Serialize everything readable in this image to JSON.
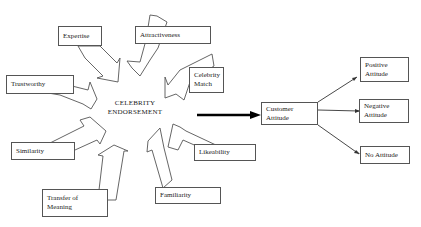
{
  "diagram": {
    "center": {
      "line1": "CELEBRITY",
      "line2": "ENDORSEMENT"
    },
    "factors": {
      "expertise": "Expertise",
      "attractiveness": "Attractiveness",
      "celebrity_match_1": "Celebrity",
      "celebrity_match_2": "Match",
      "trustworthy": "Trustworthy",
      "similarity": "Similarity",
      "transfer_1": "Transfer of",
      "transfer_2": "Meaning",
      "familiarity": "Familiarity",
      "likeability": "Likeability"
    },
    "customer_attitude": {
      "line1": "Customer",
      "line2": "Attitude"
    },
    "outcomes": {
      "positive_1": "Positive",
      "positive_2": "Attitude",
      "negative_1": "Negative",
      "negative_2": "Attitude",
      "none": "No Attitude"
    },
    "colors": {
      "stroke": "#555555",
      "text": "#222222",
      "background": "#ffffff",
      "main_arrow": "#000000"
    }
  }
}
